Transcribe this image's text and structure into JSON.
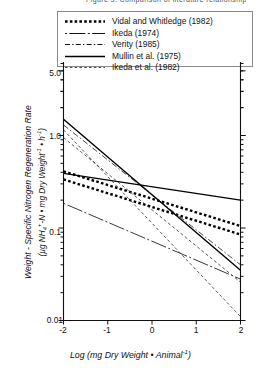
{
  "figure": {
    "top_partial_caption": "Figure 3. Comparison of literature relationships",
    "legend": {
      "entries": [
        {
          "label": "Vidal and Whitledge (1982)",
          "style": "thick-dotted",
          "key_name": "legend-key-vidal"
        },
        {
          "label": "Ikeda (1974)",
          "style": "dash-dot-long",
          "key_name": "legend-key-ikeda-1974"
        },
        {
          "label": "Verity (1985)",
          "style": "dash-dot",
          "key_name": "legend-key-verity"
        },
        {
          "label": "Mullin et al. (1975)",
          "style": "solid",
          "key_name": "legend-key-mullin"
        },
        {
          "label": "Ikeda et al. (1982)",
          "style": "fine-dashed",
          "key_name": "legend-key-ikeda-1982"
        }
      ]
    },
    "yaxis": {
      "title_line1": "Weight - Specific Nitrogen Regeneration Rate",
      "title_line2_prefix": "(µg NH",
      "title_line2_sub": "4",
      "title_line2_supplus": "+",
      "title_line2_mid": "-N • mg Dry Weight",
      "title_line2_sup1": "-1",
      "title_line2_mid2": " • h",
      "title_line2_sup2": "-1",
      "title_line2_suffix": ")",
      "tick_labels": [
        "5.0",
        "1.0",
        "0.1",
        "0.01"
      ]
    },
    "xaxis": {
      "title_prefix": "Log (mg Dry Weight • Animal",
      "title_sup": "-1",
      "title_suffix": ")",
      "tick_labels": [
        "-2",
        "-1",
        "0",
        "1",
        "2"
      ]
    }
  },
  "chart_data": {
    "type": "line",
    "title": "",
    "xlabel": "Log (mg Dry Weight • Animal⁻¹)",
    "ylabel": "Weight-Specific Nitrogen Regeneration Rate (µg NH4+-N • mg Dry Weight⁻¹ • h⁻¹)",
    "xlim": [
      -2,
      2
    ],
    "ylim": [
      0.01,
      5.0
    ],
    "yscale": "log",
    "xscale": "linear",
    "grid": false,
    "legend_position": "top",
    "x_ticks": [
      -2,
      -1,
      0,
      1,
      2
    ],
    "y_ticks": [
      0.01,
      0.1,
      1.0,
      5.0
    ],
    "series": [
      {
        "name": "Vidal and Whitledge (1982)",
        "style": "thick-dotted",
        "color": "#000000",
        "points": [
          {
            "x": -2,
            "y": 0.41
          },
          {
            "x": 2,
            "y": 0.105
          }
        ]
      },
      {
        "name": "Vidal and Whitledge (1982) b",
        "style": "thick-dotted",
        "color": "#000000",
        "points": [
          {
            "x": -2,
            "y": 0.335
          },
          {
            "x": 2,
            "y": 0.085
          }
        ]
      },
      {
        "name": "Ikeda (1974)",
        "style": "dash-dot-long",
        "color": "#222222",
        "points": [
          {
            "x": -2,
            "y": 0.185
          },
          {
            "x": 2,
            "y": 0.028
          }
        ]
      },
      {
        "name": "Verity (1985)",
        "style": "dash-dot",
        "color": "#333333",
        "points": [
          {
            "x": -2,
            "y": 1.3
          },
          {
            "x": 2,
            "y": 0.04
          }
        ]
      },
      {
        "name": "Mullin et al. (1975)",
        "style": "solid",
        "color": "#000000",
        "points": [
          {
            "x": -2,
            "y": 0.39
          },
          {
            "x": 2,
            "y": 0.2
          }
        ]
      },
      {
        "name": "Mullin et al. (1975) b",
        "style": "solid",
        "color": "#000000",
        "points": [
          {
            "x": -2,
            "y": 1.5
          },
          {
            "x": 2,
            "y": 0.035
          }
        ]
      },
      {
        "name": "Ikeda et al. (1982)",
        "style": "fine-dashed",
        "color": "#3a3a3a",
        "points": [
          {
            "x": -2,
            "y": 1.15
          },
          {
            "x": 2,
            "y": 0.011
          }
        ]
      },
      {
        "name": "Ikeda et al. (1982) b",
        "style": "fine-dashed",
        "color": "#3a3a3a",
        "points": [
          {
            "x": -2,
            "y": 0.95
          },
          {
            "x": 2,
            "y": 0.026
          }
        ]
      }
    ]
  }
}
